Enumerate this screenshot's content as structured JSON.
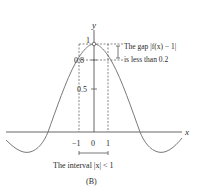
{
  "figure": {
    "panel_label": "(B)",
    "axes": {
      "x_label": "x",
      "y_label": "y"
    },
    "y_ticks": [
      "1",
      "0.8",
      "0.5"
    ],
    "x_ticks": [
      "−1",
      "0",
      "1"
    ],
    "annotation_gap_line1": "The gap |f(x) − 1|",
    "annotation_gap_line2": "is less than 0.2",
    "annotation_interval": "The interval |x| < 1",
    "curve": "f(x) ≈ sin(x)/x style bump with maximum 1 at x = 0",
    "colors": {
      "curve": "#7a7a7a",
      "axes": "#444444",
      "text": "#2a2a2a"
    }
  }
}
